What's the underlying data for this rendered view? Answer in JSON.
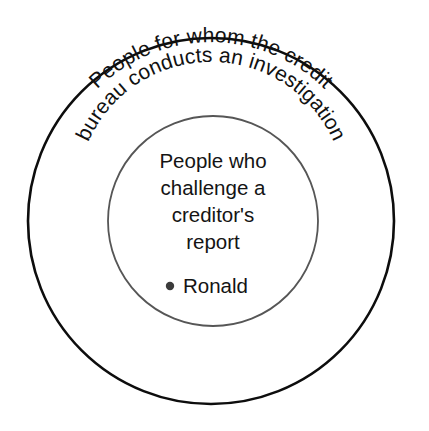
{
  "diagram": {
    "type": "euler-diagram",
    "background_color": "#ffffff",
    "width": 429,
    "height": 431,
    "outer_set": {
      "label_line_1": "People for whom the credit",
      "label_line_2": "bureau conducts an investigation",
      "full_label": "People for whom the credit bureau conducts an investigation",
      "stroke_color": "#0d0d0d",
      "center_x": 211,
      "center_y": 221,
      "radius": 183
    },
    "inner_set": {
      "lines": [
        "People who",
        "challenge a",
        "creditor's",
        "report"
      ],
      "full_label": "People who challenge a creditor's report",
      "stroke_color": "#565656",
      "center_x": 213,
      "center_y": 221,
      "radius": 105,
      "members": [
        {
          "name": "Ronald",
          "bullet": "•"
        }
      ]
    }
  }
}
